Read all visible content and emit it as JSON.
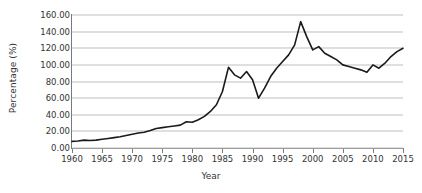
{
  "chart_data": {
    "type": "line",
    "title": "",
    "xlabel": "Year",
    "ylabel": "Percentage (%)",
    "xlim": [
      1960,
      2015
    ],
    "ylim": [
      0,
      160
    ],
    "grid": "horizontal",
    "legend": "none",
    "xticks": [
      1960,
      1965,
      1970,
      1975,
      1980,
      1985,
      1990,
      1995,
      2000,
      2005,
      2010,
      2015
    ],
    "xtick_labels": [
      "1960",
      "1965",
      "1970",
      "1975",
      "1980",
      "1985",
      "1990",
      "1995",
      "2000",
      "2005",
      "2010",
      "2015"
    ],
    "yticks": [
      0,
      20,
      40,
      60,
      80,
      100,
      120,
      140,
      160
    ],
    "ytick_labels": [
      "0.00",
      "20.00",
      "40.00",
      "60.00",
      "80.00",
      "100.00",
      "120.00",
      "140.00",
      "160.00"
    ],
    "line_color": "#1a1a1a",
    "line_width": 1.6,
    "grid_color": "#bfbfbf",
    "axis_color": "#7a7a7a",
    "background": "#ffffff",
    "x": [
      1960,
      1961,
      1962,
      1963,
      1964,
      1965,
      1966,
      1967,
      1968,
      1969,
      1970,
      1971,
      1972,
      1973,
      1974,
      1975,
      1976,
      1977,
      1978,
      1979,
      1980,
      1981,
      1982,
      1983,
      1984,
      1985,
      1986,
      1987,
      1988,
      1989,
      1990,
      1991,
      1992,
      1993,
      1994,
      1995,
      1996,
      1997,
      1998,
      1999,
      2000,
      2001,
      2002,
      2003,
      2004,
      2005,
      2006,
      2007,
      2008,
      2009,
      2010,
      2011,
      2012,
      2013,
      2014,
      2015
    ],
    "values": [
      8.0,
      8.5,
      9.5,
      9.0,
      9.5,
      10.5,
      11.5,
      12.5,
      13.5,
      15.0,
      16.5,
      18.0,
      19.0,
      21.0,
      23.5,
      24.5,
      25.5,
      26.5,
      27.5,
      31.5,
      31.0,
      34.0,
      38.0,
      44.0,
      52.0,
      68.0,
      97.0,
      88.0,
      84.0,
      92.0,
      82.0,
      60.0,
      72.0,
      86.0,
      96.0,
      104.0,
      112.0,
      124.0,
      152.0,
      134.0,
      118.0,
      122.0,
      114.0,
      110.0,
      106.0,
      100.0,
      98.0,
      96.0,
      94.0,
      91.0,
      100.0,
      96.0,
      102.0,
      110.0,
      116.0,
      120.0
    ],
    "series_name": "Percentage"
  }
}
